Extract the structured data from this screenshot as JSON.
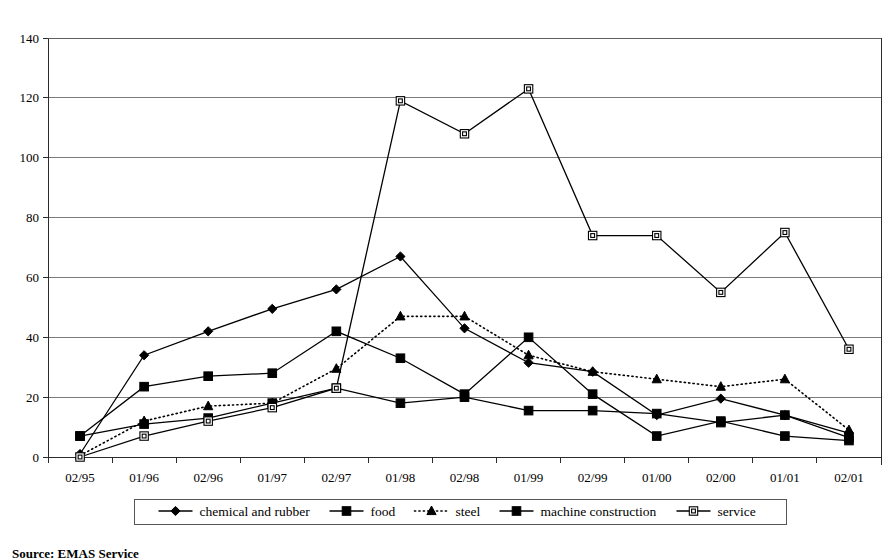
{
  "chart_data": {
    "type": "line",
    "title": "",
    "xlabel": "",
    "ylabel": "",
    "ylim": [
      0,
      140
    ],
    "ytick_step": 20,
    "grid": true,
    "legend_position": "bottom",
    "categories": [
      "02/95",
      "01/96",
      "02/96",
      "01/97",
      "02/97",
      "01/98",
      "02/98",
      "01/99",
      "02/99",
      "01/00",
      "02/00",
      "01/01",
      "02/01"
    ],
    "yticks": [
      "0",
      "20",
      "40",
      "60",
      "80",
      "100",
      "120",
      "140"
    ],
    "series": [
      {
        "name": "chemical and rubber",
        "marker": "diamond-filled",
        "line": "solid",
        "values": [
          1,
          34,
          42,
          49.5,
          56,
          67,
          43,
          31.5,
          28.5,
          14,
          19.5,
          14,
          8
        ]
      },
      {
        "name": "food",
        "marker": "square-filled",
        "line": "solid",
        "values": [
          7,
          23.5,
          27,
          28,
          42,
          33,
          21,
          40,
          21,
          7,
          12,
          7,
          5.5
        ]
      },
      {
        "name": "steel",
        "marker": "triangle-filled",
        "line": "dotted",
        "values": [
          0.5,
          12,
          17,
          18,
          29.5,
          47,
          47,
          34,
          28.5,
          26,
          23.5,
          26,
          9
        ]
      },
      {
        "name": "machine construction",
        "marker": "square-filled",
        "line": "solid",
        "values": [
          7,
          11,
          13,
          18,
          23,
          18,
          20,
          15.5,
          15.5,
          14.5,
          11.5,
          14,
          6.5
        ]
      },
      {
        "name": "service",
        "marker": "square-open",
        "line": "solid",
        "values": [
          0,
          7,
          12,
          16.5,
          23,
          119,
          108,
          123,
          74,
          74,
          55,
          75,
          36
        ]
      }
    ]
  },
  "legend": {
    "items": [
      {
        "label": "chemical and rubber",
        "marker": "diamond-filled",
        "line": "solid"
      },
      {
        "label": "food",
        "marker": "square-filled",
        "line": "solid"
      },
      {
        "label": "steel",
        "marker": "triangle-filled",
        "line": "dotted"
      },
      {
        "label": "machine construction",
        "marker": "square-filled",
        "line": "dashed"
      },
      {
        "label": "service",
        "marker": "square-open",
        "line": "solid"
      }
    ]
  },
  "footer": {
    "source": "Source: EMAS Service"
  }
}
